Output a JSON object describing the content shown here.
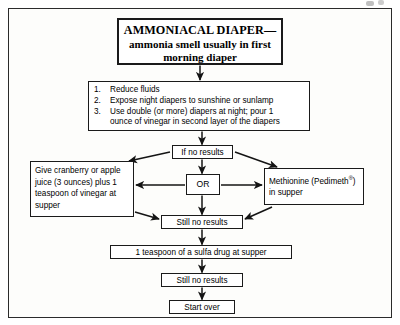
{
  "page": {
    "kind": "scanned-flowchart",
    "background_color": "#ffffff",
    "frame_color": "#2b2b2b",
    "line_color": "#1a1a1a"
  },
  "flowchart": {
    "title_node": {
      "line1": "AMMONIACAL DIAPER—",
      "line2": "ammonia smell usually in first",
      "line3": "morning diaper"
    },
    "steps_node": {
      "items": [
        {
          "number": "1.",
          "text": "Reduce fluids"
        },
        {
          "number": "2.",
          "text": "Expose night diapers to sunshine or sunlamp"
        },
        {
          "number": "3.",
          "text": "Use double (or more) diapers at night; pour 1"
        },
        {
          "number": "",
          "text": "ounce of vinegar in second layer of the diapers"
        }
      ]
    },
    "if_no_results_node": {
      "label": "If no results"
    },
    "left_treatment_node": {
      "line1": "Give cranberry or apple",
      "line2": "juice (3 ounces) plus 1",
      "line3": "teaspoon of vinegar at",
      "line4": "supper"
    },
    "or_node": {
      "label": "OR"
    },
    "right_treatment_node": {
      "line1_pre": "Methionine (Pedimeth",
      "line1_sup": "®",
      "line1_post": ")",
      "line2": "in supper"
    },
    "still_no_results_node_1": {
      "label": "Still no results"
    },
    "sulfa_node": {
      "label": "1 teaspoon of a sulfa drug at supper"
    },
    "still_no_results_node_2": {
      "label": "Still no results"
    },
    "start_over_node": {
      "label": "Start over"
    }
  },
  "connectors": [
    {
      "name": "title-to-steps",
      "kind": "arrow-down"
    },
    {
      "name": "steps-to-if-no-results",
      "kind": "arrow-down"
    },
    {
      "name": "if-no-results-to-left",
      "kind": "arrow-diagonal-left"
    },
    {
      "name": "if-no-results-to-right",
      "kind": "arrow-diagonal-right"
    },
    {
      "name": "if-no-results-to-or",
      "kind": "arrow-down"
    },
    {
      "name": "or-to-left",
      "kind": "arrow-left"
    },
    {
      "name": "or-to-right",
      "kind": "arrow-right"
    },
    {
      "name": "or-to-still-no-results",
      "kind": "arrow-down"
    },
    {
      "name": "left-to-still-no-results",
      "kind": "arrow-diagonal-right-down"
    },
    {
      "name": "right-to-still-no-results",
      "kind": "arrow-diagonal-left-down"
    },
    {
      "name": "still-no-results-to-sulfa",
      "kind": "arrow-down"
    },
    {
      "name": "sulfa-to-still-no-results-2",
      "kind": "arrow-down"
    },
    {
      "name": "still-no-results-2-to-start-over",
      "kind": "arrow-down"
    }
  ]
}
